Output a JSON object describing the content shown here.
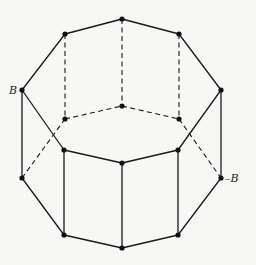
{
  "diagram": {
    "type": "graph",
    "colors": {
      "line": "#1a1a1a",
      "vertex": "#111111",
      "background": "#f7f7f5"
    },
    "vertices": [
      {
        "id": "t0",
        "x": 122,
        "y": 19
      },
      {
        "id": "t1",
        "x": 179,
        "y": 34
      },
      {
        "id": "t2",
        "x": 221,
        "y": 90
      },
      {
        "id": "t3",
        "x": 178,
        "y": 150
      },
      {
        "id": "t4",
        "x": 122,
        "y": 163
      },
      {
        "id": "t5",
        "x": 64,
        "y": 150
      },
      {
        "id": "t6",
        "x": 22,
        "y": 90
      },
      {
        "id": "t7",
        "x": 65,
        "y": 34
      },
      {
        "id": "h0",
        "x": 122,
        "y": 106
      },
      {
        "id": "h1",
        "x": 179,
        "y": 119
      },
      {
        "id": "h7",
        "x": 65,
        "y": 119
      },
      {
        "id": "b2",
        "x": 221,
        "y": 178
      },
      {
        "id": "b3",
        "x": 178,
        "y": 235
      },
      {
        "id": "b4",
        "x": 122,
        "y": 248
      },
      {
        "id": "b5",
        "x": 64,
        "y": 235
      },
      {
        "id": "b6",
        "x": 22,
        "y": 178
      }
    ],
    "edges_solid": [
      [
        "t7",
        "t0"
      ],
      [
        "t0",
        "t1"
      ],
      [
        "t1",
        "t2"
      ],
      [
        "t6",
        "t7"
      ],
      [
        "t6",
        "t5"
      ],
      [
        "t5",
        "t4"
      ],
      [
        "t4",
        "t3"
      ],
      [
        "t3",
        "t2"
      ],
      [
        "t6",
        "b6"
      ],
      [
        "t2",
        "b2"
      ],
      [
        "t5",
        "b5"
      ],
      [
        "t4",
        "b4"
      ],
      [
        "t3",
        "b3"
      ],
      [
        "b6",
        "b5"
      ],
      [
        "b5",
        "b4"
      ],
      [
        "b4",
        "b3"
      ],
      [
        "b3",
        "b2"
      ]
    ],
    "edges_dashed": [
      [
        "t7",
        "h7"
      ],
      [
        "t0",
        "h0"
      ],
      [
        "t1",
        "h1"
      ],
      [
        "h7",
        "h0"
      ],
      [
        "h0",
        "h1"
      ],
      [
        "b6",
        "h7"
      ],
      [
        "h1",
        "b2"
      ]
    ],
    "labels": [
      {
        "id": "label-b",
        "text": "B",
        "x": 9,
        "y": 94
      },
      {
        "id": "label-neg-b",
        "text": "–B",
        "x": 225,
        "y": 182
      }
    ]
  }
}
